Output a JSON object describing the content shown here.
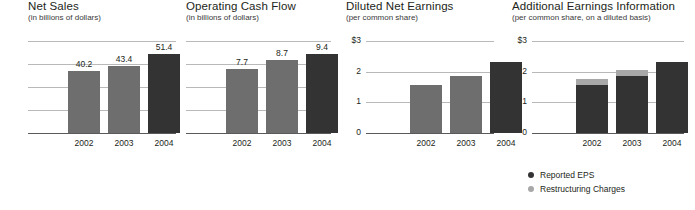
{
  "colors": {
    "bar_mid": "#6e6e6e",
    "bar_dark": "#333333",
    "bar_light": "#a8a8a8",
    "gridline": "#b9b9b9",
    "baseline": "#5a5a5a",
    "text": "#231f20"
  },
  "legend": {
    "items": [
      {
        "label": "Reported EPS",
        "color": "#333333",
        "icon": "legend-dot-icon"
      },
      {
        "label": "Restructuring Charges",
        "color": "#a8a8a8",
        "icon": "legend-dot-icon"
      }
    ]
  },
  "chart_data": [
    {
      "type": "bar",
      "title": "Net Sales",
      "subtitle": "(in billions of dollars)",
      "xlabel": "",
      "ylabel": "",
      "categories": [
        "2002",
        "2003",
        "2004"
      ],
      "values": [
        40.2,
        43.4,
        51.4
      ],
      "value_labels": [
        "40.2",
        "43.4",
        "51.4"
      ],
      "bar_colors": [
        "#6e6e6e",
        "#6e6e6e",
        "#333333"
      ],
      "ylim": [
        0,
        60
      ],
      "yticks": [],
      "ytick_labels": [],
      "gridlines": 5,
      "grid": true,
      "legend_position": "none"
    },
    {
      "type": "bar",
      "title": "Operating Cash Flow",
      "subtitle": "(in billions of dollars)",
      "xlabel": "",
      "ylabel": "",
      "categories": [
        "2002",
        "2003",
        "2004"
      ],
      "values": [
        7.7,
        8.7,
        9.4
      ],
      "value_labels": [
        "7.7",
        "8.7",
        "9.4"
      ],
      "bar_colors": [
        "#6e6e6e",
        "#6e6e6e",
        "#333333"
      ],
      "ylim": [
        0,
        11
      ],
      "yticks": [],
      "ytick_labels": [],
      "gridlines": 5,
      "grid": true,
      "legend_position": "none"
    },
    {
      "type": "bar",
      "title": "Diluted Net Earnings",
      "subtitle": "(per common share)",
      "xlabel": "",
      "ylabel": "",
      "categories": [
        "2002",
        "2003",
        "2004"
      ],
      "values": [
        1.55,
        1.85,
        2.3
      ],
      "value_labels": [
        "",
        "",
        ""
      ],
      "bar_colors": [
        "#6e6e6e",
        "#6e6e6e",
        "#333333"
      ],
      "ylim": [
        0,
        3
      ],
      "yticks": [
        3,
        2,
        1,
        0
      ],
      "ytick_labels": [
        "$3",
        "2",
        "1",
        "0"
      ],
      "gridlines": 4,
      "grid": true,
      "legend_position": "none"
    },
    {
      "type": "bar",
      "title": "Additional Earnings Information",
      "subtitle": "(per common share, on a diluted basis)",
      "xlabel": "",
      "ylabel": "",
      "categories": [
        "2002",
        "2003",
        "2004"
      ],
      "stacked": true,
      "series": [
        {
          "name": "Reported EPS",
          "color": "#333333",
          "values": [
            1.55,
            1.85,
            2.3
          ]
        },
        {
          "name": "Restructuring Charges",
          "color": "#a8a8a8",
          "values": [
            0.22,
            0.22,
            0.0
          ]
        }
      ],
      "value_labels": [
        "",
        "",
        ""
      ],
      "ylim": [
        0,
        3
      ],
      "yticks": [
        3,
        2,
        1,
        0
      ],
      "ytick_labels": [
        "$3",
        "2",
        "1",
        "0"
      ],
      "gridlines": 4,
      "grid": true,
      "legend_position": "below"
    }
  ]
}
